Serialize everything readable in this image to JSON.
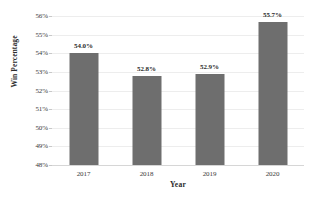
{
  "chart_data": {
    "type": "bar",
    "title": "",
    "xlabel": "Year",
    "ylabel": "Win Percentage",
    "categories": [
      "2017",
      "2018",
      "2019",
      "2020"
    ],
    "values": [
      54.0,
      52.8,
      52.9,
      55.7
    ],
    "value_labels": [
      "54.0%",
      "52.8%",
      "52.9%",
      "55.7%"
    ],
    "ylim": [
      48,
      56
    ],
    "ytick_labels": [
      "56%",
      "55%",
      "54%",
      "53%",
      "52%",
      "51%",
      "50%",
      "49%",
      "48%"
    ],
    "ytick_values": [
      56,
      55,
      54,
      53,
      52,
      51,
      50,
      49,
      48
    ],
    "grid": true,
    "legend": false,
    "bar_color": "#6e6e6e",
    "gridline_color": "#ededed",
    "axis_color": "#d6d6d6"
  },
  "title_remnant": "",
  "axis": {
    "x_title": "Year",
    "y_title": "Win Percentage"
  }
}
